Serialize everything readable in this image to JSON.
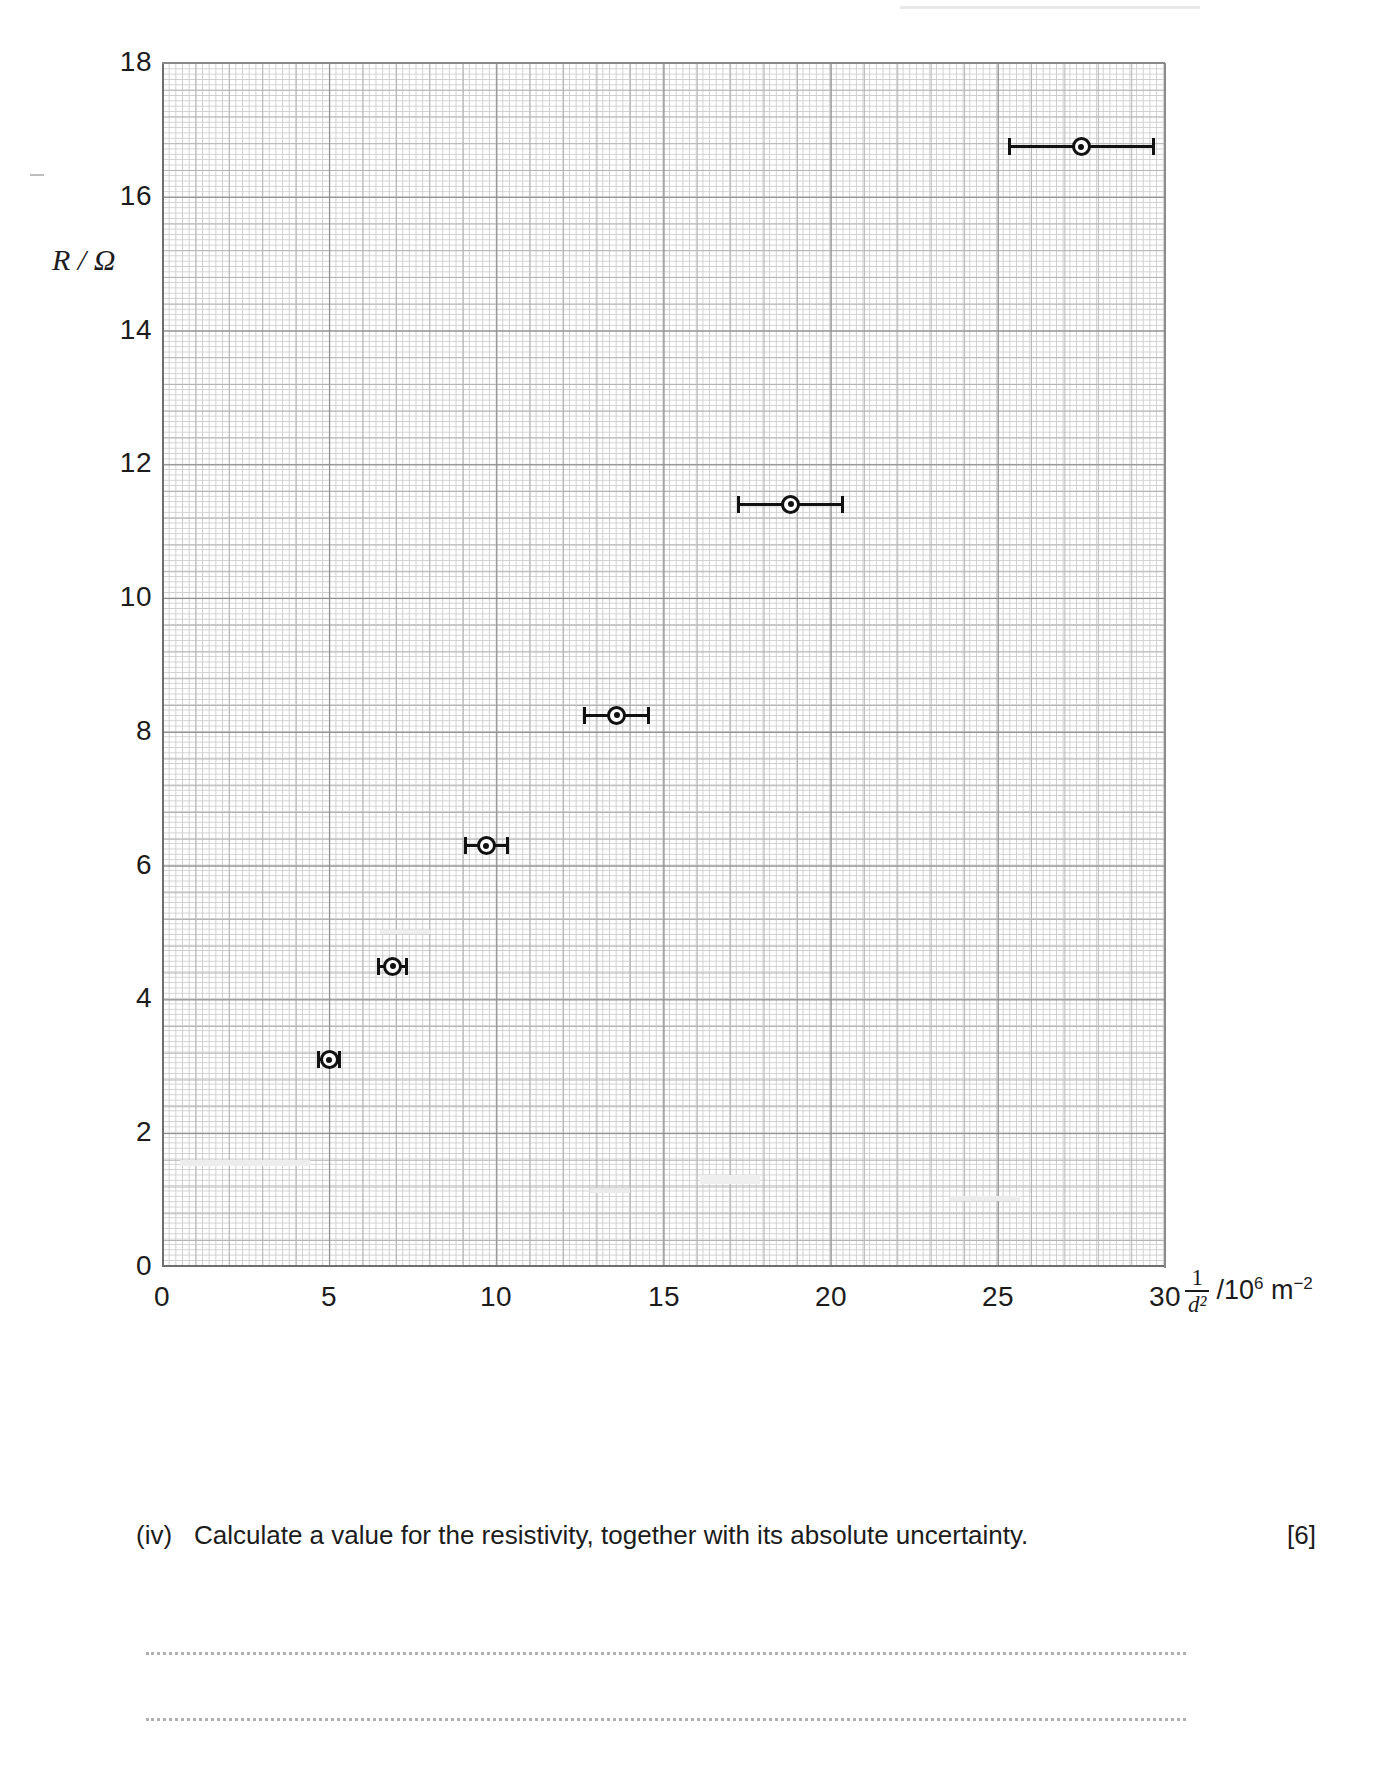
{
  "chart_data": {
    "type": "scatter",
    "title": "",
    "xlabel": "1/d² /10⁶ m⁻²",
    "ylabel": "R / Ω",
    "xlim": [
      0,
      30
    ],
    "ylim": [
      0,
      18
    ],
    "grid": true,
    "legend": "none",
    "x_ticks": [
      "0",
      "5",
      "10",
      "15",
      "20",
      "25",
      "30"
    ],
    "x_tick_values": [
      0,
      5,
      10,
      15,
      20,
      25,
      30
    ],
    "y_ticks": [
      "0",
      "2",
      "4",
      "6",
      "8",
      "10",
      "12",
      "14",
      "16",
      "18"
    ],
    "y_tick_values": [
      0,
      2,
      4,
      6,
      8,
      10,
      12,
      14,
      16,
      18
    ],
    "x_axis_unit": "10⁶ m⁻²",
    "y_axis_unit": "Ω",
    "error_bars": "horizontal (x) only",
    "points": [
      {
        "x": 5.0,
        "y": 3.1,
        "xerr": 0.32
      },
      {
        "x": 6.9,
        "y": 4.5,
        "xerr": 0.42
      },
      {
        "x": 9.7,
        "y": 6.3,
        "xerr": 0.62
      },
      {
        "x": 13.6,
        "y": 8.25,
        "xerr": 0.95
      },
      {
        "x": 18.8,
        "y": 11.4,
        "xerr": 1.55
      },
      {
        "x": 27.5,
        "y": 16.75,
        "xerr": 2.15
      }
    ],
    "series": [
      {
        "name": "R vs 1/d²",
        "x": [
          5.0,
          6.9,
          9.7,
          13.6,
          18.8,
          27.5
        ],
        "y": [
          3.1,
          4.5,
          6.3,
          8.25,
          11.4,
          16.75
        ],
        "xerr": [
          0.32,
          0.42,
          0.62,
          0.95,
          1.55,
          2.15
        ]
      }
    ]
  },
  "axis_titles": {
    "y": "R / Ω",
    "x_fraction_numerator": "1",
    "x_fraction_denominator": "d²",
    "x_unit_prefix": "/10",
    "x_unit_exponent": "6",
    "x_unit_metre": "m",
    "x_unit_metre_exponent": "−2"
  },
  "question": {
    "number": "(iv)",
    "text": "Calculate a value for the resistivity, together with its absolute uncertainty.",
    "marks": "[6]"
  },
  "answer_lines": [
    "",
    "",
    ""
  ]
}
